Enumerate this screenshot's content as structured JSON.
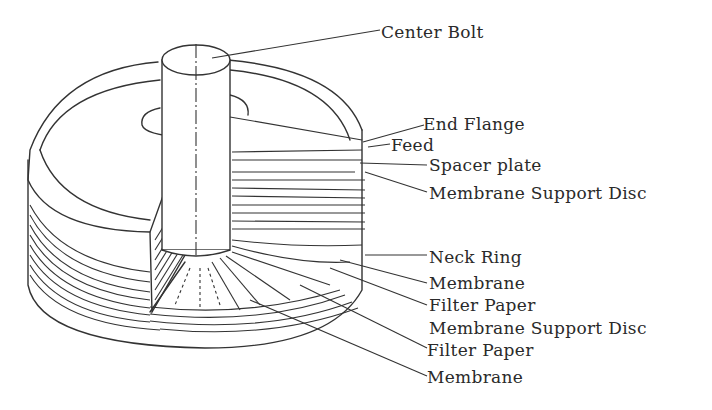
{
  "diagram": {
    "labels": [
      {
        "id": "center-bolt",
        "text": "Center Bolt",
        "x": 381,
        "y": 22
      },
      {
        "id": "end-flange",
        "text": "End Flange",
        "x": 423,
        "y": 114
      },
      {
        "id": "feed",
        "text": "Feed",
        "x": 391,
        "y": 138
      },
      {
        "id": "spacer-plate",
        "text": "Spacer plate",
        "x": 429,
        "y": 155
      },
      {
        "id": "membrane-support-disc-1",
        "text": "Membrane Support Disc",
        "x": 429,
        "y": 183
      },
      {
        "id": "neck-ring",
        "text": "Neck Ring",
        "x": 429,
        "y": 247
      },
      {
        "id": "membrane-1",
        "text": "Membrane",
        "x": 429,
        "y": 273
      },
      {
        "id": "filter-paper-1",
        "text": "Filter Paper",
        "x": 429,
        "y": 295
      },
      {
        "id": "membrane-support-disc-2",
        "text": "Membrane Support Disc",
        "x": 429,
        "y": 318
      },
      {
        "id": "filter-paper-2",
        "text": "Filter Paper",
        "x": 427,
        "y": 340
      },
      {
        "id": "membrane-2",
        "text": "Membrane",
        "x": 427,
        "y": 367
      }
    ]
  }
}
